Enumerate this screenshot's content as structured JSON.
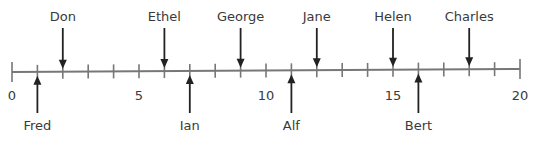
{
  "number_line": {
    "min": 0,
    "max": 20,
    "tick_step": 1,
    "major_labels": [
      {
        "value": 0,
        "label": "0"
      },
      {
        "value": 5,
        "label": "5"
      },
      {
        "value": 10,
        "label": "10"
      },
      {
        "value": 15,
        "label": "15"
      },
      {
        "value": 20,
        "label": "20"
      }
    ],
    "above": [
      {
        "name": "Don",
        "value": 2
      },
      {
        "name": "Ethel",
        "value": 6
      },
      {
        "name": "George",
        "value": 9
      },
      {
        "name": "Jane",
        "value": 12
      },
      {
        "name": "Helen",
        "value": 15
      },
      {
        "name": "Charles",
        "value": 18
      }
    ],
    "below": [
      {
        "name": "Fred",
        "value": 1
      },
      {
        "name": "Ian",
        "value": 7
      },
      {
        "name": "Alf",
        "value": 11
      },
      {
        "name": "Bert",
        "value": 16
      }
    ],
    "line_color": "#777777",
    "arrow_color": "#222222"
  }
}
